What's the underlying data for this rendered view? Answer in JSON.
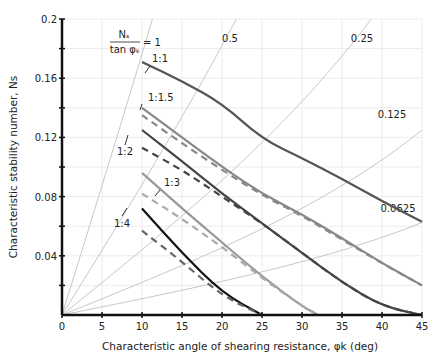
{
  "chart_data": {
    "type": "line",
    "title": "",
    "xlabel": "Characteristic angle of shearing resistance, φk (deg)",
    "ylabel": "Characteristic stability number, Ns",
    "xlim": [
      0,
      45
    ],
    "ylim": [
      0,
      0.2
    ],
    "grid": true,
    "x_ticks": [
      0,
      5,
      10,
      15,
      20,
      25,
      30,
      35,
      40,
      45
    ],
    "x_tick_labels": [
      "0",
      "5",
      "10",
      "15",
      "20",
      "25",
      "30",
      "35",
      "40",
      "45"
    ],
    "y_ticks": [
      0.04,
      0.08,
      0.12,
      0.16,
      0.2
    ],
    "y_tick_labels": [
      "0.04",
      "0.08",
      "0.12",
      "0.16",
      "0.2"
    ],
    "ratio_lines": {
      "label_prefix": "Ns / tan φk =",
      "values": [
        1,
        0.5,
        0.25,
        0.125,
        0.0625
      ],
      "labels": [
        "1",
        "0.5",
        "0.25",
        "0.125",
        "0.0625"
      ],
      "color": "#c8c8c8"
    },
    "series": [
      {
        "name": "1:1",
        "style": "solid",
        "color": "#555555",
        "x": [
          10,
          15,
          20,
          25,
          30,
          35,
          40,
          45
        ],
        "y": [
          0.171,
          0.158,
          0.143,
          0.119,
          0.106,
          0.092,
          0.077,
          0.063
        ]
      },
      {
        "name": "1:1.5",
        "style": "solid",
        "color": "#888888",
        "x": [
          10,
          15,
          20,
          25,
          30,
          35,
          40,
          45
        ],
        "y": [
          0.14,
          0.12,
          0.1,
          0.082,
          0.068,
          0.052,
          0.035,
          0.02
        ]
      },
      {
        "name": "1:1.5 (dashed)",
        "style": "dashed",
        "color": "#888888",
        "x": [
          10,
          15,
          20,
          25,
          30,
          35,
          40,
          45
        ],
        "y": [
          0.135,
          0.116,
          0.098,
          0.081,
          0.067,
          0.051,
          0.035,
          0.02
        ]
      },
      {
        "name": "1:2",
        "style": "solid",
        "color": "#444444",
        "x": [
          10,
          15,
          20,
          25,
          30,
          35,
          40,
          45
        ],
        "y": [
          0.125,
          0.104,
          0.082,
          0.062,
          0.042,
          0.022,
          0.006,
          0.0
        ]
      },
      {
        "name": "1:2 (dashed)",
        "style": "dashed",
        "color": "#444444",
        "x": [
          10,
          15,
          20,
          25,
          30,
          35,
          40,
          45
        ],
        "y": [
          0.113,
          0.098,
          0.08,
          0.062,
          0.042,
          0.022,
          0.006,
          0.0
        ]
      },
      {
        "name": "1:3",
        "style": "solid",
        "color": "#999999",
        "x": [
          10,
          15,
          20,
          25,
          30,
          32
        ],
        "y": [
          0.096,
          0.072,
          0.049,
          0.026,
          0.006,
          0.0
        ]
      },
      {
        "name": "1:3 (dashed)",
        "style": "dashed",
        "color": "#aaaaaa",
        "x": [
          10,
          15,
          20,
          25,
          30,
          32
        ],
        "y": [
          0.082,
          0.065,
          0.046,
          0.025,
          0.006,
          0.0
        ]
      },
      {
        "name": "1:4",
        "style": "solid",
        "color": "#111111",
        "x": [
          10,
          15,
          20,
          25
        ],
        "y": [
          0.072,
          0.042,
          0.015,
          0.0
        ]
      },
      {
        "name": "1:4 (dashed)",
        "style": "dashed",
        "color": "#666666",
        "x": [
          10,
          15,
          20,
          25
        ],
        "y": [
          0.057,
          0.036,
          0.013,
          0.0
        ]
      }
    ],
    "curve_labels": [
      "1:1",
      "1:1.5",
      "1:2",
      "1:3",
      "1:4"
    ],
    "legend": null
  }
}
